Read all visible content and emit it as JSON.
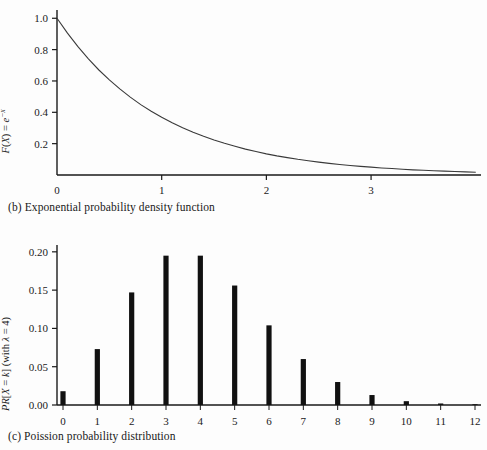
{
  "figure": {
    "background_color": "#fdfdfd",
    "ink_color": "#1a1a1a"
  },
  "panels": [
    {
      "id": "exponential",
      "caption": "(b) Exponential probability density function",
      "ylabel_parts": {
        "fx": "F",
        "open": "(",
        "x": "X",
        "close": ") = ",
        "e": "e",
        "exp": "−x"
      },
      "ylabel_plain": "F(X) = e−x"
    },
    {
      "id": "poisson",
      "caption": "(c) Poission probability distribution",
      "ylabel_parts": {
        "pr": "PR",
        "bracket_open": "[",
        "x": "X",
        "eq": " = ",
        "k": "k",
        "bracket_close": "] ",
        "lambda_text": "(with λ = 4)"
      },
      "ylabel_plain": "PR[X = k] (with λ = 4)"
    }
  ],
  "chart_data": [
    {
      "type": "line",
      "title": "",
      "caption": "(b) Exponential probability density function",
      "xlabel": "",
      "ylabel": "F(X) = e^-x",
      "xlim": [
        0,
        4.05
      ],
      "ylim": [
        0,
        1.04
      ],
      "xticks": [
        0,
        1,
        2,
        3
      ],
      "xticklabels": [
        "0",
        "1",
        "2",
        "3"
      ],
      "yticks": [
        0.2,
        0.4,
        0.6,
        0.8,
        1.0
      ],
      "yticklabels": [
        "0.2",
        "0.4",
        "0.6",
        "0.8",
        "1.0"
      ],
      "grid": false,
      "legend": null,
      "series": [
        {
          "name": "e^-x",
          "x": [
            0,
            0.1,
            0.2,
            0.3,
            0.4,
            0.5,
            0.6,
            0.7,
            0.8,
            0.9,
            1.0,
            1.1,
            1.2,
            1.3,
            1.4,
            1.5,
            1.6,
            1.7,
            1.8,
            1.9,
            2.0,
            2.1,
            2.2,
            2.3,
            2.4,
            2.5,
            2.6,
            2.7,
            2.8,
            2.9,
            3.0,
            3.1,
            3.2,
            3.3,
            3.4,
            3.5,
            3.6,
            3.7,
            3.8,
            3.9,
            4.0
          ],
          "y": [
            1.0,
            0.905,
            0.819,
            0.741,
            0.67,
            0.607,
            0.549,
            0.497,
            0.449,
            0.407,
            0.368,
            0.333,
            0.301,
            0.273,
            0.247,
            0.223,
            0.202,
            0.183,
            0.165,
            0.15,
            0.135,
            0.122,
            0.111,
            0.1,
            0.091,
            0.082,
            0.074,
            0.067,
            0.061,
            0.055,
            0.05,
            0.045,
            0.041,
            0.037,
            0.033,
            0.03,
            0.027,
            0.025,
            0.022,
            0.02,
            0.018
          ]
        }
      ]
    },
    {
      "type": "bar",
      "title": "",
      "caption": "(c) Poission probability distribution",
      "xlabel": "",
      "ylabel": "PR[X = k] (with λ = 4)",
      "lambda": 4,
      "xlim": [
        -0.5,
        12.5
      ],
      "ylim": [
        0,
        0.205
      ],
      "categories": [
        "0",
        "1",
        "2",
        "3",
        "4",
        "5",
        "6",
        "7",
        "8",
        "9",
        "10",
        "11",
        "12"
      ],
      "values": [
        0.018,
        0.073,
        0.147,
        0.195,
        0.195,
        0.156,
        0.104,
        0.06,
        0.03,
        0.013,
        0.005,
        0.002,
        0.001
      ],
      "yticks": [
        0.0,
        0.05,
        0.1,
        0.15,
        0.2
      ],
      "yticklabels": [
        "0.00",
        "0.05",
        "0.10",
        "0.15",
        "0.20"
      ],
      "grid": false,
      "legend": null,
      "bar_color": "#111111"
    }
  ]
}
